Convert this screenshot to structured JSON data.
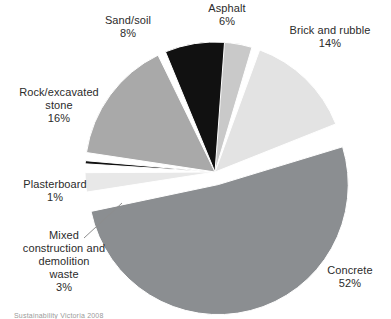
{
  "chart_data": {
    "type": "pie",
    "title": "",
    "subtitle": "",
    "xlabel": "",
    "ylabel": "",
    "legend_position": "none",
    "grid": false,
    "units": "percent",
    "total": 100,
    "categories": [
      "Concrete",
      "Rock/excavated stone",
      "Brick and rubble",
      "Sand/soil",
      "Asphalt",
      "Mixed construction and demolition waste",
      "Plasterboard"
    ],
    "values": [
      52,
      16,
      14,
      8,
      6,
      3,
      1
    ],
    "slices": [
      {
        "id": "asphalt",
        "name": "Asphalt",
        "value": 6,
        "value_label": "6%",
        "color": "#c9c9c9",
        "start_angle": -4,
        "sweep": 21.6,
        "exploded": false,
        "label_lines": [
          "Asphalt",
          "6%"
        ]
      },
      {
        "id": "brick-and-rubble",
        "name": "Brick and rubble",
        "value": 14,
        "value_label": "14%",
        "color": "#e3e3e3",
        "start_angle": 19,
        "sweep": 50.4,
        "exploded": false,
        "label_lines": [
          "Brick and rubble",
          "14%"
        ]
      },
      {
        "id": "concrete",
        "name": "Concrete",
        "value": 52,
        "value_label": "52%",
        "color": "#8b8e91",
        "start_angle": 72,
        "sweep": 187.2,
        "exploded": true,
        "label_lines": [
          "Concrete",
          "52%"
        ]
      },
      {
        "id": "mixed-construction-and-demolition-waste",
        "name": "Mixed construction and demolition waste",
        "value": 3,
        "value_label": "3%",
        "color": "#e8e8e8",
        "start_angle": 260,
        "sweep": 10.8,
        "exploded": false,
        "label_lines": [
          "Mixed",
          "construction and",
          "demolition",
          "waste",
          "3%"
        ]
      },
      {
        "id": "plasterboard",
        "name": "Plasterboard",
        "value": 1,
        "value_label": "1%",
        "color": "#111111",
        "start_angle": 272.5,
        "sweep": 3.6,
        "exploded": false,
        "label_lines": [
          "Plasterboard",
          "1%"
        ]
      },
      {
        "id": "rock-excavated-stone",
        "name": "Rock/excavated stone",
        "value": 16,
        "value_label": "16%",
        "color": "#a9a9a9",
        "start_angle": 277.5,
        "sweep": 57.6,
        "exploded": false,
        "label_lines": [
          "Rock/excavated",
          "stone",
          "16%"
        ]
      },
      {
        "id": "sand-soil",
        "name": "Sand/soil",
        "value": 8,
        "value_label": "8%",
        "color": "#111111",
        "start_angle": 336.5,
        "sweep": 28.8,
        "exploded": false,
        "label_lines": [
          "Sand/soil",
          "8%"
        ]
      }
    ],
    "geometry": {
      "center_x": 215,
      "center_y": 172,
      "radius": 130,
      "gap_degrees": 2.2,
      "explode_offset": 13,
      "background": "#ffffff",
      "separator_color": "#ffffff"
    }
  },
  "labels": {
    "asphalt": "Asphalt\n6%",
    "brick": "Brick and rubble\n14%",
    "sand": "Sand/soil\n8%",
    "rock": "Rock/excavated\nstone\n16%",
    "plasterboard": "Plasterboard\n1%",
    "mixed": "Mixed\nconstruction and\ndemolition\nwaste\n3%",
    "concrete": "Concrete\n52%"
  },
  "caption": {
    "text": "Sustainability Victoria 2008"
  },
  "colors": {
    "text": "#2b2b2b",
    "background": "#ffffff",
    "leader_line": "#8d8d8d"
  }
}
